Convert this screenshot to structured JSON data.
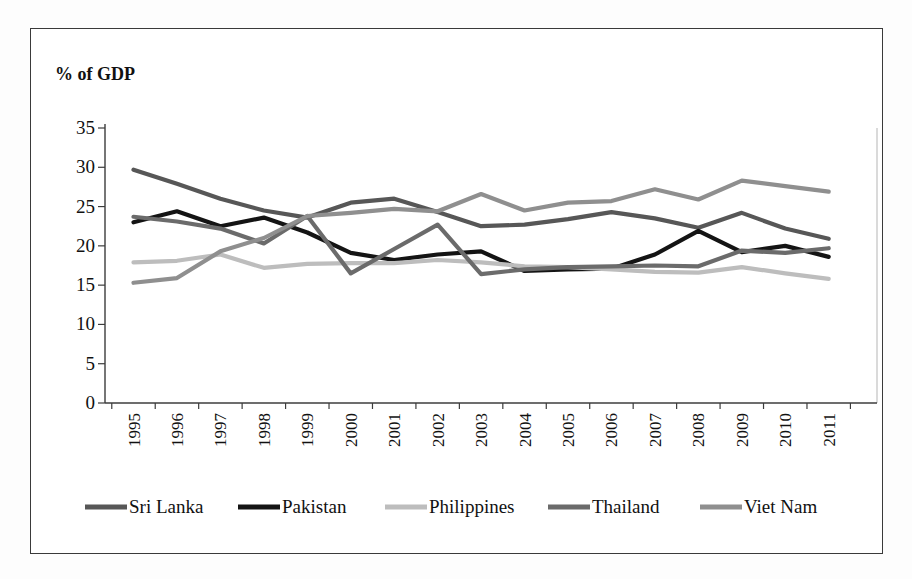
{
  "title": "% of GDP",
  "chart_data": {
    "type": "line",
    "title": "% of GDP",
    "categories": [
      "1995",
      "1996",
      "1997",
      "1998",
      "1999",
      "2000",
      "2001",
      "2002",
      "2003",
      "2004",
      "2005",
      "2006",
      "2007",
      "2008",
      "2009",
      "2010",
      "2011"
    ],
    "ylim": [
      0,
      35
    ],
    "ytick_step": 5,
    "yticks": [
      0,
      5,
      10,
      15,
      20,
      25,
      30,
      35
    ],
    "grid": "off",
    "legend_position": "bottom",
    "series": [
      {
        "name": "Sri Lanka",
        "color": "#575757",
        "values": [
          29.7,
          27.9,
          26.0,
          24.5,
          23.6,
          25.5,
          26.0,
          24.3,
          22.5,
          22.7,
          23.4,
          24.3,
          23.5,
          22.3,
          24.2,
          22.2,
          20.9
        ]
      },
      {
        "name": "Pakistan",
        "color": "#141414",
        "values": [
          23.0,
          24.4,
          22.5,
          23.6,
          21.7,
          19.1,
          18.2,
          18.9,
          19.3,
          16.8,
          17.0,
          17.1,
          18.9,
          21.9,
          19.2,
          20.0,
          18.6
        ]
      },
      {
        "name": "Philippines",
        "color": "#bdbdbd",
        "values": [
          17.9,
          18.1,
          18.9,
          17.2,
          17.7,
          17.8,
          17.8,
          18.2,
          17.9,
          17.4,
          17.3,
          17.0,
          16.7,
          16.6,
          17.3,
          16.5,
          15.8
        ]
      },
      {
        "name": "Thailand",
        "color": "#6b6b6b",
        "values": [
          23.7,
          23.1,
          22.2,
          20.3,
          23.8,
          16.5,
          19.6,
          22.7,
          16.4,
          17.0,
          17.3,
          17.4,
          17.5,
          17.4,
          19.4,
          19.1,
          19.7
        ]
      },
      {
        "name": "Viet Nam",
        "color": "#8f8f8f",
        "values": [
          15.3,
          15.9,
          19.3,
          21.0,
          23.8,
          24.2,
          24.7,
          24.4,
          26.6,
          24.5,
          25.5,
          25.7,
          27.2,
          25.9,
          28.3,
          27.6,
          26.9
        ]
      }
    ]
  },
  "axis_color": "#3c3c3c",
  "plot_border_color": "#b5b5b5"
}
